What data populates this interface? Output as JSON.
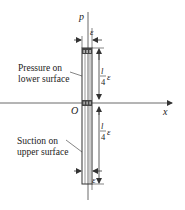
{
  "diagram": {
    "axes": {
      "vertical_label": "p",
      "horizontal_label": "x",
      "origin_label": "O"
    },
    "annotations": {
      "upper_label_line1": "Pressure on",
      "upper_label_line2": "lower surface",
      "lower_label_line1": "Suction on",
      "lower_label_line2": "upper surface"
    },
    "dimensions": {
      "top_width": "ε",
      "bottom_width": "ε",
      "upper_height_num": "l",
      "upper_height_den": "4",
      "upper_height_suffix": "ε",
      "lower_height_num": "l",
      "lower_height_den": "4",
      "lower_height_suffix": "ε"
    },
    "colors": {
      "line": "#333333",
      "text": "#222222",
      "background": "#ffffff"
    }
  }
}
